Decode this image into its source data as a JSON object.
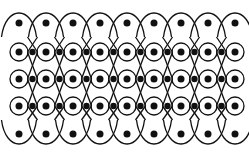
{
  "figure": {
    "stroke_color": "#111111",
    "background": "#ffffff",
    "columns_x": [
      19,
      46,
      73,
      100,
      127,
      154,
      181,
      208,
      235
    ],
    "top_dot_row_y": 23,
    "ring_rows_y": [
      52,
      79,
      106
    ],
    "bottom_dot_row_y": 134,
    "ring_radius": 9,
    "dot_radius": 3.5
  }
}
